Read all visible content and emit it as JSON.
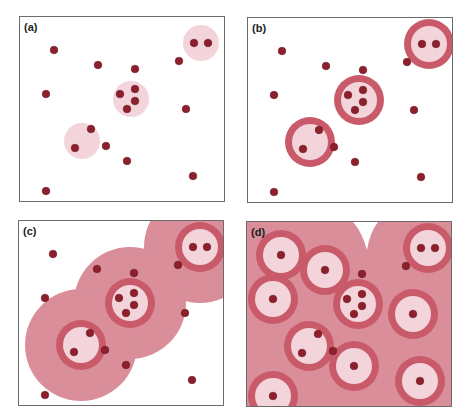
{
  "colors": {
    "dot": "#8e1f2c",
    "dot_stroke": "#6a1420",
    "inner_fill": "#f2d4da",
    "ring": "#c95a6a",
    "halo": "#d98e9a"
  },
  "points": [
    [
      34,
      33
    ],
    [
      78,
      48
    ],
    [
      115,
      52
    ],
    [
      159,
      44
    ],
    [
      174,
      26
    ],
    [
      188,
      26
    ],
    [
      26,
      77
    ],
    [
      100,
      77
    ],
    [
      115,
      72
    ],
    [
      115,
      84
    ],
    [
      107,
      92
    ],
    [
      166,
      92
    ],
    [
      71,
      112
    ],
    [
      55,
      131
    ],
    [
      86,
      129
    ],
    [
      107,
      144
    ],
    [
      173,
      159
    ],
    [
      26,
      174
    ]
  ],
  "clusters": [
    {
      "cx": 181,
      "cy": 26
    },
    {
      "cx": 111,
      "cy": 82
    },
    {
      "cx": 62,
      "cy": 124
    }
  ],
  "extra_buffers_d": [
    {
      "cx": 34,
      "cy": 33
    },
    {
      "cx": 78,
      "cy": 48
    },
    {
      "cx": 26,
      "cy": 77
    },
    {
      "cx": 166,
      "cy": 92
    },
    {
      "cx": 107,
      "cy": 144
    },
    {
      "cx": 173,
      "cy": 159
    },
    {
      "cx": 26,
      "cy": 174
    }
  ],
  "panels": [
    {
      "id": "a",
      "label": "(a)",
      "x": 19,
      "y": 16,
      "mode": "inner"
    },
    {
      "id": "b",
      "label": "(b)",
      "x": 247,
      "y": 17,
      "mode": "ring"
    },
    {
      "id": "c",
      "label": "(c)",
      "x": 18,
      "y": 220,
      "mode": "halo"
    },
    {
      "id": "d",
      "label": "(d)",
      "x": 246,
      "y": 221,
      "mode": "full"
    }
  ]
}
